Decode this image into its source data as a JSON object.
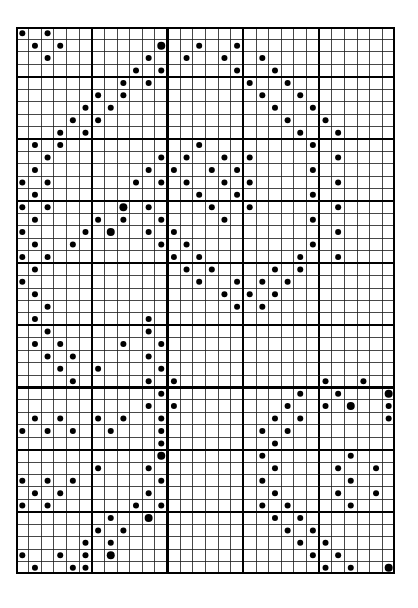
{
  "document": {
    "kind": "punched-card-style dot matrix chart",
    "title": "",
    "background_color": "#ffffff",
    "ink_color": "#000000"
  },
  "grid": {
    "columns": 30,
    "rows": 44,
    "cell_width": 12.633,
    "cell_height": 12.43,
    "origin_x": 0,
    "origin_y": 0,
    "thin_line_color": "#1a1a1a",
    "thin_line_width": 0.8,
    "thick_line_color": "#000000",
    "thick_line_width": 2.2,
    "border_width": 2.4,
    "thick_columns": [
      0,
      6,
      12,
      18,
      24,
      30
    ],
    "thick_rows": [
      0,
      4,
      9,
      14,
      19,
      24,
      29,
      34,
      39,
      44
    ]
  },
  "marks": {
    "shape": "filled-circle",
    "color": "#000000",
    "radius_normal": 3.0,
    "radius_large": 4.0,
    "count": 246,
    "points": [
      [
        0,
        0,
        1
      ],
      [
        2,
        0,
        1
      ],
      [
        1,
        1,
        1
      ],
      [
        3,
        1,
        1
      ],
      [
        11,
        1,
        2
      ],
      [
        14,
        1,
        1
      ],
      [
        17,
        1,
        1
      ],
      [
        2,
        2,
        1
      ],
      [
        10,
        2,
        1
      ],
      [
        13,
        2,
        1
      ],
      [
        16,
        2,
        1
      ],
      [
        19,
        2,
        1
      ],
      [
        9,
        3,
        1
      ],
      [
        11,
        3,
        1
      ],
      [
        17,
        3,
        1
      ],
      [
        20,
        3,
        1
      ],
      [
        8,
        4,
        1
      ],
      [
        10,
        4,
        1
      ],
      [
        18,
        4,
        1
      ],
      [
        21,
        4,
        1
      ],
      [
        6,
        5,
        1
      ],
      [
        8,
        5,
        1
      ],
      [
        19,
        5,
        1
      ],
      [
        22,
        5,
        1
      ],
      [
        5,
        6,
        1
      ],
      [
        7,
        6,
        1
      ],
      [
        20,
        6,
        1
      ],
      [
        23,
        6,
        1
      ],
      [
        4,
        7,
        1
      ],
      [
        6,
        7,
        1
      ],
      [
        21,
        7,
        1
      ],
      [
        24,
        7,
        1
      ],
      [
        3,
        8,
        1
      ],
      [
        5,
        8,
        1
      ],
      [
        22,
        8,
        1
      ],
      [
        25,
        8,
        1
      ],
      [
        1,
        9,
        1
      ],
      [
        3,
        9,
        1
      ],
      [
        14,
        9,
        1
      ],
      [
        23,
        9,
        1
      ],
      [
        2,
        10,
        1
      ],
      [
        11,
        10,
        1
      ],
      [
        13,
        10,
        1
      ],
      [
        16,
        10,
        1
      ],
      [
        18,
        10,
        1
      ],
      [
        25,
        10,
        1
      ],
      [
        1,
        11,
        1
      ],
      [
        10,
        11,
        1
      ],
      [
        12,
        11,
        1
      ],
      [
        15,
        11,
        1
      ],
      [
        17,
        11,
        1
      ],
      [
        23,
        11,
        1
      ],
      [
        0,
        12,
        1
      ],
      [
        2,
        12,
        1
      ],
      [
        9,
        12,
        1
      ],
      [
        11,
        12,
        1
      ],
      [
        13,
        12,
        1
      ],
      [
        16,
        12,
        1
      ],
      [
        18,
        12,
        1
      ],
      [
        25,
        12,
        1
      ],
      [
        1,
        13,
        1
      ],
      [
        14,
        13,
        1
      ],
      [
        17,
        13,
        1
      ],
      [
        23,
        13,
        1
      ],
      [
        0,
        14,
        1
      ],
      [
        2,
        14,
        1
      ],
      [
        8,
        14,
        2
      ],
      [
        10,
        14,
        1
      ],
      [
        15,
        14,
        1
      ],
      [
        18,
        14,
        1
      ],
      [
        25,
        14,
        1
      ],
      [
        1,
        15,
        1
      ],
      [
        6,
        15,
        1
      ],
      [
        8,
        15,
        1
      ],
      [
        11,
        15,
        1
      ],
      [
        16,
        15,
        1
      ],
      [
        23,
        15,
        1
      ],
      [
        0,
        16,
        1
      ],
      [
        5,
        16,
        1
      ],
      [
        7,
        16,
        2
      ],
      [
        10,
        16,
        1
      ],
      [
        12,
        16,
        1
      ],
      [
        25,
        16,
        1
      ],
      [
        1,
        17,
        1
      ],
      [
        4,
        17,
        1
      ],
      [
        11,
        17,
        1
      ],
      [
        13,
        17,
        1
      ],
      [
        23,
        17,
        1
      ],
      [
        0,
        18,
        1
      ],
      [
        2,
        18,
        1
      ],
      [
        12,
        18,
        1
      ],
      [
        14,
        18,
        1
      ],
      [
        22,
        18,
        1
      ],
      [
        25,
        18,
        1
      ],
      [
        1,
        19,
        1
      ],
      [
        13,
        19,
        1
      ],
      [
        15,
        19,
        1
      ],
      [
        20,
        19,
        1
      ],
      [
        22,
        19,
        1
      ],
      [
        0,
        20,
        1
      ],
      [
        14,
        20,
        1
      ],
      [
        17,
        20,
        1
      ],
      [
        19,
        20,
        1
      ],
      [
        21,
        20,
        1
      ],
      [
        1,
        21,
        1
      ],
      [
        16,
        21,
        1
      ],
      [
        18,
        21,
        1
      ],
      [
        20,
        21,
        1
      ],
      [
        2,
        22,
        1
      ],
      [
        17,
        22,
        1
      ],
      [
        19,
        22,
        1
      ],
      [
        1,
        23,
        1
      ],
      [
        10,
        23,
        1
      ],
      [
        2,
        24,
        1
      ],
      [
        10,
        24,
        1
      ],
      [
        1,
        25,
        1
      ],
      [
        3,
        25,
        1
      ],
      [
        8,
        25,
        1
      ],
      [
        11,
        25,
        1
      ],
      [
        2,
        26,
        1
      ],
      [
        4,
        26,
        1
      ],
      [
        10,
        26,
        1
      ],
      [
        3,
        27,
        1
      ],
      [
        6,
        27,
        1
      ],
      [
        11,
        27,
        1
      ],
      [
        4,
        28,
        1
      ],
      [
        10,
        28,
        1
      ],
      [
        12,
        28,
        1
      ],
      [
        24,
        28,
        1
      ],
      [
        27,
        28,
        1
      ],
      [
        11,
        29,
        1
      ],
      [
        22,
        29,
        1
      ],
      [
        25,
        29,
        1
      ],
      [
        29,
        29,
        2
      ],
      [
        10,
        30,
        1
      ],
      [
        12,
        30,
        1
      ],
      [
        21,
        30,
        1
      ],
      [
        24,
        30,
        1
      ],
      [
        26,
        30,
        2
      ],
      [
        29,
        30,
        1
      ],
      [
        1,
        31,
        1
      ],
      [
        3,
        31,
        1
      ],
      [
        6,
        31,
        1
      ],
      [
        8,
        31,
        1
      ],
      [
        11,
        31,
        1
      ],
      [
        20,
        31,
        1
      ],
      [
        22,
        31,
        1
      ],
      [
        29,
        31,
        1
      ],
      [
        0,
        32,
        1
      ],
      [
        2,
        32,
        1
      ],
      [
        4,
        32,
        1
      ],
      [
        7,
        32,
        1
      ],
      [
        11,
        32,
        1
      ],
      [
        19,
        32,
        1
      ],
      [
        21,
        32,
        1
      ],
      [
        11,
        33,
        1
      ],
      [
        20,
        33,
        1
      ],
      [
        11,
        34,
        2
      ],
      [
        19,
        34,
        1
      ],
      [
        26,
        34,
        1
      ],
      [
        6,
        35,
        1
      ],
      [
        10,
        35,
        1
      ],
      [
        20,
        35,
        1
      ],
      [
        25,
        35,
        1
      ],
      [
        28,
        35,
        1
      ],
      [
        0,
        36,
        1
      ],
      [
        2,
        36,
        1
      ],
      [
        4,
        36,
        1
      ],
      [
        11,
        36,
        1
      ],
      [
        19,
        36,
        1
      ],
      [
        26,
        36,
        1
      ],
      [
        1,
        37,
        1
      ],
      [
        3,
        37,
        1
      ],
      [
        10,
        37,
        1
      ],
      [
        20,
        37,
        1
      ],
      [
        25,
        37,
        1
      ],
      [
        28,
        37,
        1
      ],
      [
        0,
        38,
        1
      ],
      [
        2,
        38,
        1
      ],
      [
        9,
        38,
        1
      ],
      [
        11,
        38,
        1
      ],
      [
        19,
        38,
        1
      ],
      [
        21,
        38,
        1
      ],
      [
        26,
        38,
        1
      ],
      [
        7,
        39,
        1
      ],
      [
        10,
        39,
        2
      ],
      [
        20,
        39,
        1
      ],
      [
        22,
        39,
        1
      ],
      [
        6,
        40,
        1
      ],
      [
        8,
        40,
        1
      ],
      [
        21,
        40,
        1
      ],
      [
        23,
        40,
        1
      ],
      [
        5,
        41,
        1
      ],
      [
        7,
        41,
        1
      ],
      [
        22,
        41,
        1
      ],
      [
        24,
        41,
        1
      ],
      [
        0,
        42,
        1
      ],
      [
        3,
        42,
        1
      ],
      [
        5,
        42,
        1
      ],
      [
        7,
        42,
        2
      ],
      [
        23,
        42,
        1
      ],
      [
        25,
        42,
        1
      ],
      [
        1,
        43,
        1
      ],
      [
        4,
        43,
        1
      ],
      [
        5,
        43,
        1
      ],
      [
        24,
        43,
        1
      ],
      [
        26,
        43,
        1
      ],
      [
        29,
        43,
        2
      ]
    ]
  }
}
